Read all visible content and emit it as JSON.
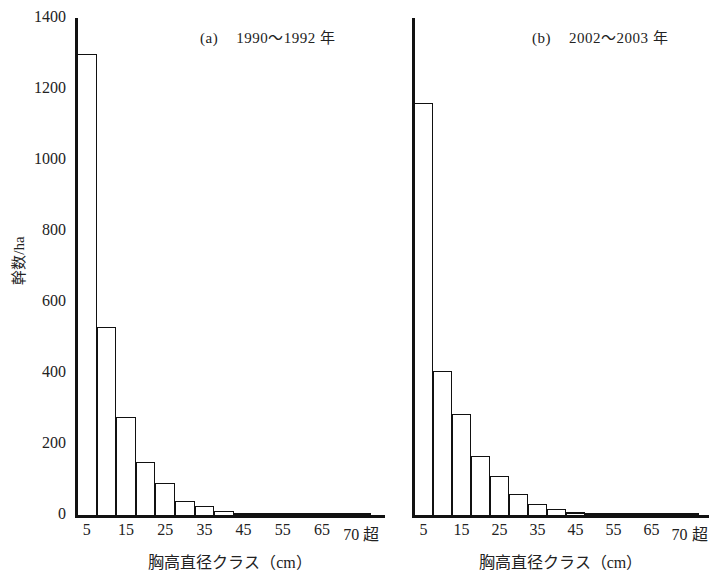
{
  "figure": {
    "ylabel": "幹数/ha",
    "xlabel": "胸高直径クラス（cm）",
    "y_ticks": [
      "0",
      "200",
      "400",
      "600",
      "800",
      "1000",
      "1200",
      "1400"
    ],
    "x_ticks": [
      "5",
      "15",
      "25",
      "35",
      "45",
      "55",
      "65",
      "70 超"
    ]
  },
  "panels": [
    {
      "id": "a",
      "label": "(a)",
      "period": "1990〜1992 年"
    },
    {
      "id": "b",
      "label": "(b)",
      "period": "2002〜2003 年"
    }
  ],
  "chart_data": [
    {
      "type": "bar",
      "title": "(a)　1990〜1992 年",
      "xlabel": "胸高直径クラス（cm）",
      "ylabel": "幹数/ha",
      "ylim": [
        0,
        1400
      ],
      "yticks": [
        0,
        200,
        400,
        600,
        800,
        1000,
        1200,
        1400
      ],
      "grid": false,
      "legend": false,
      "categories": [
        "5",
        "10",
        "15",
        "20",
        "25",
        "30",
        "35",
        "40",
        "45",
        "50",
        "55",
        "60",
        "65",
        "70",
        "70超"
      ],
      "tick_labels": [
        "5",
        "15",
        "25",
        "35",
        "45",
        "55",
        "65",
        "70 超"
      ],
      "values": [
        1300,
        530,
        275,
        150,
        90,
        40,
        25,
        10,
        5,
        3,
        2,
        1,
        0,
        0,
        6
      ]
    },
    {
      "type": "bar",
      "title": "(b)　2002〜2003 年",
      "xlabel": "胸高直径クラス（cm）",
      "ylabel": "幹数/ha",
      "ylim": [
        0,
        1400
      ],
      "yticks": [
        0,
        200,
        400,
        600,
        800,
        1000,
        1200,
        1400
      ],
      "grid": false,
      "legend": false,
      "categories": [
        "5",
        "10",
        "15",
        "20",
        "25",
        "30",
        "35",
        "40",
        "45",
        "50",
        "55",
        "60",
        "65",
        "70",
        "70超"
      ],
      "tick_labels": [
        "5",
        "15",
        "25",
        "35",
        "45",
        "55",
        "65",
        "70 超"
      ],
      "values": [
        1160,
        405,
        285,
        165,
        110,
        60,
        30,
        16,
        8,
        4,
        2,
        1,
        0,
        0,
        7
      ]
    }
  ]
}
